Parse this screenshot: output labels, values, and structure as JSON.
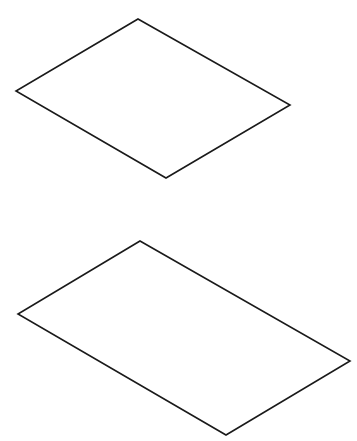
{
  "diagram": {
    "stroke_color": "#1a1a1a",
    "background": "#ffffff",
    "shapes": [
      {
        "name": "parallelogram-top",
        "points": "138,19 290,105 166,178 16,91"
      },
      {
        "name": "parallelogram-bottom",
        "points": "140,241 350,361 226,435 18,314"
      }
    ]
  }
}
